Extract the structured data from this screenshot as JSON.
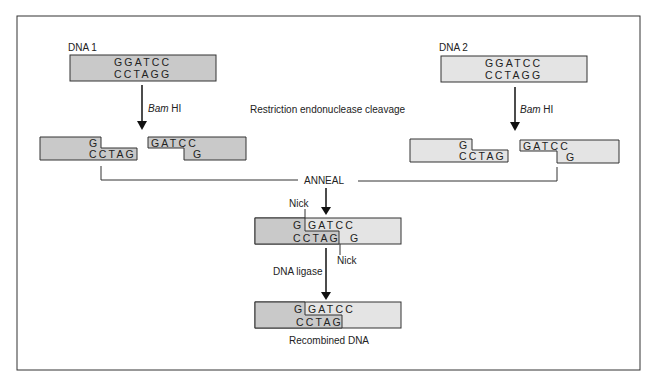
{
  "figure": {
    "dna1": {
      "label": "DNA 1",
      "top": "GGATCC",
      "bottom": "CCTAGG",
      "fill": "#c9c9c9"
    },
    "dna2": {
      "label": "DNA 2",
      "top": "GGATCC",
      "bottom": "CCTAGG",
      "fill": "#e4e4e4"
    },
    "enzyme_italic": "Bam",
    "enzyme_rest": " HI",
    "step_cleavage": "Restriction endonuclease cleavage",
    "frag1_left": {
      "top": "G",
      "bottom": "CCTAG"
    },
    "frag1_right": {
      "top": "GATCC",
      "bottom": "G"
    },
    "frag2_left": {
      "top": "G",
      "bottom": "CCTAG"
    },
    "frag2_right": {
      "top": "GATCC",
      "bottom": "G"
    },
    "step_anneal": "ANNEAL",
    "nick_label": "Nick",
    "annealed": {
      "top_left": "G",
      "top_right": "GATCC",
      "bottom_left": "CCTAG",
      "bottom_right": "G"
    },
    "step_ligase": "DNA ligase",
    "recombined": {
      "top_left": "G",
      "top_right": "GATCC",
      "bottom_left": "CCTAG"
    },
    "caption": "Recombined DNA"
  }
}
